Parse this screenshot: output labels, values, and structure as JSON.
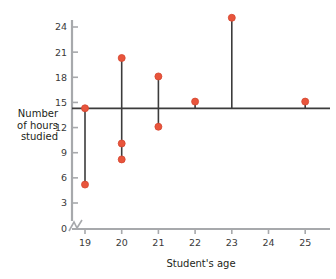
{
  "chart_data": {
    "type": "scatter",
    "title": "",
    "xlabel": "Student's age",
    "ylabel": "Number of hours studied",
    "ylabel_lines": [
      "Number",
      "of hours",
      "studied"
    ],
    "x": [
      19,
      20,
      21,
      22,
      23,
      25
    ],
    "xlim": [
      18.6,
      25.6
    ],
    "ylim": [
      0,
      26
    ],
    "xticks": [
      19,
      20,
      21,
      22,
      23,
      24,
      25
    ],
    "xtick_labels": [
      "19",
      "20",
      "21",
      "22",
      "23",
      "24",
      "25"
    ],
    "yticks": [
      0,
      3,
      6,
      9,
      12,
      15,
      18,
      21,
      24
    ],
    "ytick_labels": [
      "0",
      "3",
      "6",
      "9",
      "12",
      "15",
      "18",
      "21",
      "24"
    ],
    "grid": false,
    "legend": null,
    "axis_break": true,
    "mean_line_value": 14.3,
    "points": [
      {
        "x": 19,
        "y": 14.3
      },
      {
        "x": 19,
        "y": 5.2
      },
      {
        "x": 20,
        "y": 20.3
      },
      {
        "x": 20,
        "y": 10.1
      },
      {
        "x": 20,
        "y": 8.2
      },
      {
        "x": 21,
        "y": 18.1
      },
      {
        "x": 21,
        "y": 12.1
      },
      {
        "x": 22,
        "y": 15.1
      },
      {
        "x": 23,
        "y": 25.1
      },
      {
        "x": 25,
        "y": 15.1
      }
    ],
    "series": [
      {
        "name": "Hours studied",
        "x": [
          19,
          19,
          20,
          20,
          20,
          21,
          21,
          22,
          23,
          25
        ],
        "values": [
          14.3,
          5.2,
          20.3,
          10.1,
          8.2,
          18.1,
          12.1,
          15.1,
          25.1,
          15.1
        ]
      }
    ],
    "deviation_segments": [
      {
        "x": 19,
        "from": 14.3,
        "to": 5.2
      },
      {
        "x": 20,
        "from": 20.3,
        "to": 8.2
      },
      {
        "x": 21,
        "from": 18.1,
        "to": 12.1
      },
      {
        "x": 22,
        "from": 15.1,
        "to": 14.3
      },
      {
        "x": 23,
        "from": 25.1,
        "to": 14.3
      },
      {
        "x": 25,
        "from": 15.1,
        "to": 14.3
      }
    ],
    "colors": {
      "point": "#e8553c",
      "point_edge": "#d6452e",
      "line": "#3c3c3c",
      "mean_line": "#3c3c3c",
      "axis": "#a7a9ac",
      "text": "#231f20",
      "background": "#ffffff"
    }
  }
}
